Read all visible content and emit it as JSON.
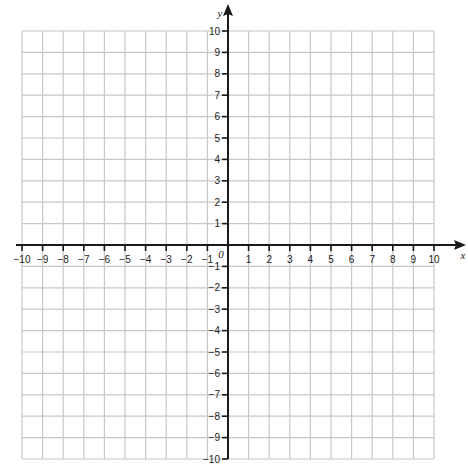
{
  "diagram": {
    "type": "coordinate-grid",
    "x_axis": {
      "label": "x",
      "min": -10,
      "max": 10,
      "step": 1
    },
    "y_axis": {
      "label": "y",
      "min": -10,
      "max": 10,
      "step": 1
    },
    "origin_label": "0",
    "x_tick_labels": [
      "-10",
      "-9",
      "-8",
      "-7",
      "-6",
      "-5",
      "-4",
      "-3",
      "-2",
      "-1",
      "1",
      "2",
      "3",
      "4",
      "5",
      "6",
      "7",
      "8",
      "9",
      "10"
    ],
    "y_tick_labels": [
      "10",
      "9",
      "8",
      "7",
      "6",
      "5",
      "4",
      "3",
      "2",
      "1",
      "-1",
      "-2",
      "-3",
      "-4",
      "-5",
      "-6",
      "-7",
      "-8",
      "-9",
      "-10"
    ]
  },
  "colors": {
    "grid": "#c8c8c8",
    "axis": "#1a1a1a",
    "background": "#ffffff"
  },
  "layout": {
    "grid_left": 22,
    "grid_right": 434,
    "grid_top": 31,
    "grid_bottom": 459,
    "x_axis_y": 245,
    "y_axis_x": 228
  }
}
